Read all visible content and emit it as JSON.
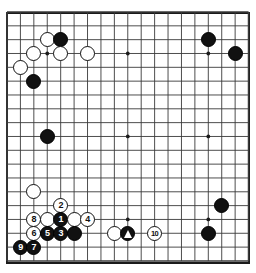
{
  "diagram": {
    "type": "go-board-diagram",
    "board_size": 19,
    "background_color": "#ffffff",
    "line_color": "#3a3a3a",
    "border_color": "#1a1a1a",
    "black_color": "#111111",
    "white_color": "#ffffff",
    "geometry": {
      "origin_x": 7,
      "origin_y": 12,
      "step_x": 13.42,
      "step_y": 13.83,
      "stone_diameter": 15
    },
    "star_points": [
      [
        3,
        3
      ],
      [
        9,
        3
      ],
      [
        15,
        3
      ],
      [
        3,
        9
      ],
      [
        9,
        9
      ],
      [
        15,
        9
      ],
      [
        3,
        15
      ],
      [
        9,
        15
      ],
      [
        15,
        15
      ]
    ],
    "stones": [
      {
        "id": "w-c16",
        "color": "white",
        "col": 3,
        "row": 2,
        "label": ""
      },
      {
        "id": "b-d16",
        "color": "black",
        "col": 4,
        "row": 2,
        "label": ""
      },
      {
        "id": "w-b15",
        "color": "white",
        "col": 2,
        "row": 3,
        "label": ""
      },
      {
        "id": "w-d15",
        "color": "white",
        "col": 4,
        "row": 3,
        "label": ""
      },
      {
        "id": "w-f15",
        "color": "white",
        "col": 6,
        "row": 3,
        "label": ""
      },
      {
        "id": "w-a14",
        "color": "white",
        "col": 1,
        "row": 4,
        "label": ""
      },
      {
        "id": "b-b13",
        "color": "black",
        "col": 2,
        "row": 5,
        "label": ""
      },
      {
        "id": "b-q16",
        "color": "black",
        "col": 15,
        "row": 2,
        "label": ""
      },
      {
        "id": "b-s15",
        "color": "black",
        "col": 17,
        "row": 3,
        "label": ""
      },
      {
        "id": "b-b10",
        "color": "black",
        "col": 3,
        "row": 9,
        "label": ""
      },
      {
        "id": "w-b5",
        "color": "white",
        "col": 2,
        "row": 13,
        "label": ""
      },
      {
        "id": "w-d4-two",
        "color": "white",
        "col": 4,
        "row": 14,
        "label": "2"
      },
      {
        "id": "w-b3-eight",
        "color": "white",
        "col": 2,
        "row": 15,
        "label": "8"
      },
      {
        "id": "w-c3",
        "color": "white",
        "col": 3,
        "row": 15,
        "label": ""
      },
      {
        "id": "b-d3-one",
        "color": "black",
        "col": 4,
        "row": 15,
        "label": "1"
      },
      {
        "id": "w-e3",
        "color": "white",
        "col": 5,
        "row": 15,
        "label": ""
      },
      {
        "id": "w-f3-four",
        "color": "white",
        "col": 6,
        "row": 15,
        "label": "4"
      },
      {
        "id": "w-b2-six",
        "color": "white",
        "col": 2,
        "row": 16,
        "label": "6"
      },
      {
        "id": "b-c2-five",
        "color": "black",
        "col": 3,
        "row": 16,
        "label": "5"
      },
      {
        "id": "b-d2-three",
        "color": "black",
        "col": 4,
        "row": 16,
        "label": "3"
      },
      {
        "id": "b-e2",
        "color": "black",
        "col": 5,
        "row": 16,
        "label": ""
      },
      {
        "id": "w-h2",
        "color": "white",
        "col": 8,
        "row": 16,
        "label": ""
      },
      {
        "id": "b-k2-marked",
        "color": "black",
        "col": 9,
        "row": 16,
        "label": "",
        "mark": "triangle"
      },
      {
        "id": "w-m2-ten",
        "color": "white",
        "col": 11,
        "row": 16,
        "label": "10"
      },
      {
        "id": "b-a1-nine",
        "color": "black",
        "col": 1,
        "row": 17,
        "label": "9"
      },
      {
        "id": "b-b1-seven",
        "color": "black",
        "col": 2,
        "row": 17,
        "label": "7"
      },
      {
        "id": "b-r6",
        "color": "black",
        "col": 16,
        "row": 14,
        "label": ""
      },
      {
        "id": "b-q2",
        "color": "black",
        "col": 15,
        "row": 16,
        "label": ""
      }
    ],
    "move_sequence": [
      "1",
      "2",
      "3",
      "4",
      "5",
      "6",
      "7",
      "8",
      "9",
      "10"
    ],
    "marks": [
      {
        "type": "triangle",
        "col": 9,
        "row": 16,
        "on": "black"
      }
    ]
  }
}
